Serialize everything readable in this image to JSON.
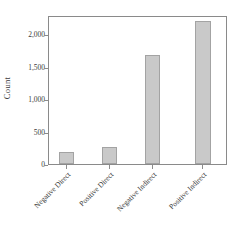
{
  "chart_data": {
    "type": "bar",
    "title": "",
    "subtitle": "",
    "xlabel": "",
    "ylabel": "Count",
    "categories": [
      "Negative Direct",
      "Positive Direct",
      "Negative Indirect",
      "Positive Indirect"
    ],
    "values": [
      190,
      270,
      1690,
      2210
    ],
    "series": [
      {
        "name": "Count",
        "values": [
          190,
          270,
          1690,
          2210
        ]
      }
    ],
    "ylim": [
      0,
      2300
    ],
    "xlim": [
      0,
      4
    ],
    "y_ticks": [
      0,
      500,
      1000,
      1500,
      2000
    ],
    "y_tick_labels": [
      "0",
      "500",
      "1,000",
      "1,500",
      "2,000"
    ],
    "grid": false,
    "legend": false,
    "legend_position": "none",
    "bar_fill_color": "#c9c9c9",
    "bar_border_color": "#a3a3a3",
    "axis_color": "#8a8a8a",
    "text_color": "#3c3c3c",
    "background_color": "#ffffff",
    "bar_centers_fraction": [
      0.1,
      0.34,
      0.58,
      0.86
    ],
    "bar_width_fraction": 0.085,
    "x_tick_label_rotation": -45
  }
}
